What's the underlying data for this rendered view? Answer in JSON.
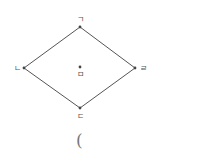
{
  "diagram": {
    "type": "rhombus",
    "stroke_color": "#555555",
    "vertices": [
      {
        "id": "top",
        "label": "ㄱ",
        "x": 80,
        "y": 27,
        "lx": 80,
        "ly": 22
      },
      {
        "id": "left",
        "label": "ㄴ",
        "x": 24,
        "y": 68,
        "lx": 17,
        "ly": 71
      },
      {
        "id": "bottom",
        "label": "ㄷ",
        "x": 80,
        "y": 108,
        "lx": 80,
        "ly": 119
      },
      {
        "id": "right",
        "label": "ㄹ",
        "x": 135,
        "y": 68,
        "lx": 143,
        "ly": 71
      }
    ],
    "center": {
      "label": "ㅁ",
      "x": 80,
      "y": 67,
      "lx": 80,
      "ly": 77
    },
    "answer_prefix": "("
  }
}
